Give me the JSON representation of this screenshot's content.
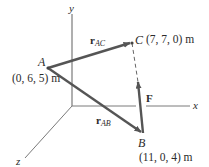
{
  "diagram": {
    "type": "3d-position-vectors",
    "axes": {
      "x": {
        "label": "x"
      },
      "y": {
        "label": "y"
      },
      "z": {
        "label": "z"
      }
    },
    "points": {
      "A": {
        "label": "A",
        "coords": "(0, 6, 5) m"
      },
      "B": {
        "label": "B",
        "coords": "(11, 0, 4) m"
      },
      "C": {
        "label": "C",
        "coords": "(7, 7, 0) m"
      }
    },
    "vectors": {
      "rAC": {
        "main": "r",
        "sub": "AC",
        "from": "A",
        "to": "C"
      },
      "rAB": {
        "main": "r",
        "sub": "AB",
        "from": "A",
        "to": "B"
      },
      "F": {
        "main": "F",
        "from": "B",
        "toward": "C"
      }
    },
    "colors": {
      "vector": "#555555",
      "axis": "#7a7a7a",
      "text": "#2b2b2b",
      "dashed": "#666666"
    }
  }
}
